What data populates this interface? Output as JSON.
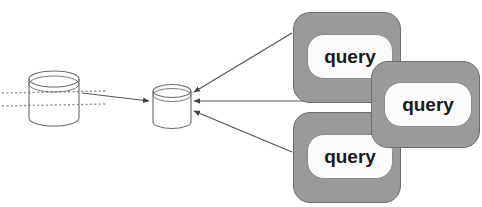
{
  "diagram": {
    "type": "data-flow-diagram",
    "canvas": {
      "width": 482,
      "height": 207,
      "background": "#ffffff"
    },
    "colors": {
      "card_fill": "#9a9a9a",
      "card_stroke": "#6e6e6e",
      "inner_fill": "#fbfbfb",
      "inner_stroke": "#8d8d8d",
      "label_text": "#1a1a1a",
      "line_stroke": "#555555",
      "cylinder_stroke": "#6b6b6b",
      "dotted_stroke": "#8f8f8f"
    },
    "nodes": [
      {
        "id": "source-database",
        "kind": "cylinder",
        "label": "",
        "x": 28,
        "y": 70,
        "width": 50,
        "height": 52
      },
      {
        "id": "target-database",
        "kind": "cylinder",
        "label": "",
        "x": 152,
        "y": 84,
        "width": 38,
        "height": 42
      }
    ],
    "cards": [
      {
        "id": "query-card-top",
        "label": "query"
      },
      {
        "id": "query-card-right",
        "label": "query"
      },
      {
        "id": "query-card-bottom",
        "label": "query"
      }
    ],
    "edges": [
      {
        "id": "edge-source-to-target",
        "from": "source-database",
        "to": "target-database",
        "arrow": "to"
      },
      {
        "id": "edge-query-top-to-target",
        "from": "query-card-top",
        "to": "target-database",
        "arrow": "to"
      },
      {
        "id": "edge-query-right-to-target",
        "from": "query-card-right",
        "to": "target-database",
        "arrow": "to"
      },
      {
        "id": "edge-query-bottom-to-target",
        "from": "query-card-bottom",
        "to": "target-database",
        "arrow": "to"
      }
    ],
    "dotted_guides": [
      {
        "id": "dotted-guide-upper",
        "y": 92
      },
      {
        "id": "dotted-guide-lower",
        "y": 104
      }
    ]
  }
}
